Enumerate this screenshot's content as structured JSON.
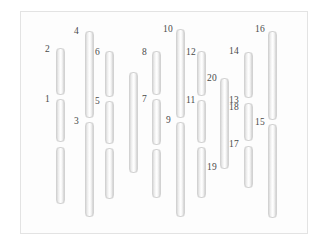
{
  "figure": {
    "title": "",
    "width": 329,
    "height": 249,
    "background_color": "#ffffff",
    "frame": {
      "x": 20,
      "y": 11,
      "width": 288,
      "height": 223,
      "border_color": "#e3e3e3",
      "fill_color": "#fdfdfd"
    },
    "bar_color_light": "#ffffff",
    "bar_color_dark": "#cfcfcf",
    "label_color": "#4a4a4a"
  },
  "chart_data": {
    "type": "diagram",
    "title": "",
    "xlabel": "",
    "ylabel": "",
    "grid": false,
    "legend": false,
    "columns": [
      {
        "column_index": 1,
        "x": 56,
        "bar_width": 9,
        "segments": [
          {
            "segment_index": 1,
            "top": 48,
            "bottom": 95
          },
          {
            "segment_index": 2,
            "top": 99,
            "bottom": 142
          },
          {
            "segment_index": 3,
            "top": 147,
            "bottom": 204
          }
        ]
      },
      {
        "column_index": 2,
        "x": 85,
        "bar_width": 9,
        "segments": [
          {
            "segment_index": 1,
            "top": 31,
            "bottom": 118
          },
          {
            "segment_index": 2,
            "top": 122,
            "bottom": 217
          }
        ]
      },
      {
        "column_index": 3,
        "x": 105,
        "bar_width": 9,
        "segments": [
          {
            "segment_index": 1,
            "top": 51,
            "bottom": 97
          },
          {
            "segment_index": 2,
            "top": 101,
            "bottom": 144
          },
          {
            "segment_index": 3,
            "top": 148,
            "bottom": 199
          }
        ]
      },
      {
        "column_index": 4,
        "x": 129,
        "bar_width": 9,
        "segments": [
          {
            "segment_index": 1,
            "top": 72,
            "bottom": 173
          }
        ]
      },
      {
        "column_index": 5,
        "x": 152,
        "bar_width": 9,
        "segments": [
          {
            "segment_index": 1,
            "top": 51,
            "bottom": 95
          },
          {
            "segment_index": 2,
            "top": 99,
            "bottom": 145
          },
          {
            "segment_index": 3,
            "top": 149,
            "bottom": 198
          }
        ]
      },
      {
        "column_index": 6,
        "x": 176,
        "bar_width": 9,
        "segments": [
          {
            "segment_index": 1,
            "top": 29,
            "bottom": 118
          },
          {
            "segment_index": 2,
            "top": 122,
            "bottom": 217
          }
        ]
      },
      {
        "column_index": 7,
        "x": 197,
        "bar_width": 9,
        "segments": [
          {
            "segment_index": 1,
            "top": 51,
            "bottom": 96
          },
          {
            "segment_index": 2,
            "top": 100,
            "bottom": 143
          },
          {
            "segment_index": 3,
            "top": 147,
            "bottom": 198
          }
        ]
      },
      {
        "column_index": 8,
        "x": 220,
        "bar_width": 9,
        "segments": [
          {
            "segment_index": 1,
            "top": 78,
            "bottom": 169
          }
        ]
      },
      {
        "column_index": 9,
        "x": 244,
        "bar_width": 9,
        "segments": [
          {
            "segment_index": 1,
            "top": 52,
            "bottom": 98
          },
          {
            "segment_index": 2,
            "top": 103,
            "bottom": 141
          },
          {
            "segment_index": 3,
            "top": 146,
            "bottom": 188
          }
        ]
      },
      {
        "column_index": 10,
        "x": 268,
        "bar_width": 9,
        "segments": [
          {
            "segment_index": 1,
            "top": 31,
            "bottom": 120
          },
          {
            "segment_index": 2,
            "top": 124,
            "bottom": 218
          }
        ]
      }
    ],
    "labels": [
      {
        "text": "2",
        "x": 45,
        "y": 44
      },
      {
        "text": "1",
        "x": 45,
        "y": 94
      },
      {
        "text": "4",
        "x": 74,
        "y": 26
      },
      {
        "text": "3",
        "x": 74,
        "y": 116
      },
      {
        "text": "6",
        "x": 95,
        "y": 47
      },
      {
        "text": "5",
        "x": 95,
        "y": 96
      },
      {
        "text": "8",
        "x": 142,
        "y": 47
      },
      {
        "text": "7",
        "x": 142,
        "y": 94
      },
      {
        "text": "10",
        "x": 163,
        "y": 24
      },
      {
        "text": "9",
        "x": 166,
        "y": 115
      },
      {
        "text": "12",
        "x": 186,
        "y": 47
      },
      {
        "text": "11",
        "x": 186,
        "y": 95
      },
      {
        "text": "20",
        "x": 207,
        "y": 73
      },
      {
        "text": "19",
        "x": 207,
        "y": 162
      },
      {
        "text": "14",
        "x": 229,
        "y": 46
      },
      {
        "text": "13",
        "x": 229,
        "y": 95
      },
      {
        "text": "18",
        "x": 229,
        "y": 102
      },
      {
        "text": "17",
        "x": 229,
        "y": 139
      },
      {
        "text": "16",
        "x": 255,
        "y": 24
      },
      {
        "text": "15",
        "x": 255,
        "y": 117
      }
    ]
  }
}
